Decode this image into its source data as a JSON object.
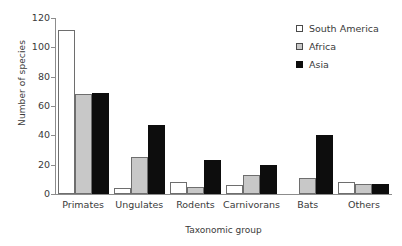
{
  "chart_data": {
    "type": "bar",
    "title": "",
    "subtitle": "",
    "xlabel": "Taxonomic group",
    "ylabel": "Number of species",
    "categories": [
      "Primates",
      "Ungulates",
      "Rodents",
      "Carnivorans",
      "Bats",
      "Others"
    ],
    "series": [
      {
        "name": "South America",
        "color": "#ffffff",
        "values": [
          112,
          4,
          8,
          6,
          0,
          8
        ]
      },
      {
        "name": "Africa",
        "color": "#c8c8c8",
        "values": [
          68,
          25,
          5,
          13,
          11,
          7
        ]
      },
      {
        "name": "Asia",
        "color": "#0d0d0d",
        "values": [
          69,
          47,
          23,
          20,
          40,
          7
        ]
      }
    ],
    "ylim": [
      0,
      120
    ],
    "yticks": [
      0,
      20,
      40,
      60,
      80,
      100,
      120
    ],
    "ytick_labels": [
      "0",
      "20",
      "40",
      "60",
      "80",
      "100",
      "120"
    ],
    "grid": false,
    "legend_position": "top-right",
    "axis_color": "#8c8c8c",
    "bar_outline_color": "#6e6e6e"
  },
  "legend": {
    "entries": [
      {
        "label": "South America"
      },
      {
        "label": "Africa"
      },
      {
        "label": "Asia"
      }
    ]
  }
}
